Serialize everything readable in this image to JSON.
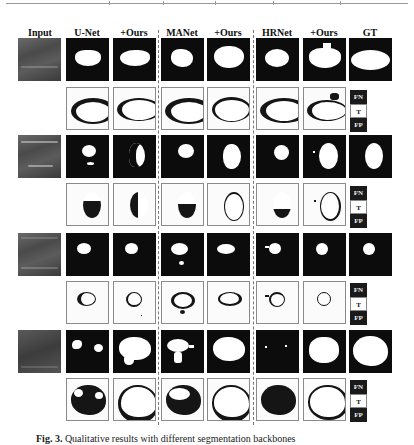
{
  "figure": {
    "caption_label": "Fig. 3.",
    "caption_text": "Qualitative results with different segmentation backbones"
  },
  "columns": [
    {
      "key": "input",
      "label": "Input"
    },
    {
      "key": "unet",
      "label": "U-Net"
    },
    {
      "key": "unet_ours",
      "label": "+Ours"
    },
    {
      "key": "manet",
      "label": "MANet"
    },
    {
      "key": "manet_ours",
      "label": "+Ours"
    },
    {
      "key": "hrnet",
      "label": "HRNet"
    },
    {
      "key": "hrnet_ours",
      "label": "+Ours"
    },
    {
      "key": "gt",
      "label": "GT"
    }
  ],
  "legend": {
    "fn": "FN",
    "t": "T",
    "fp": "FP"
  },
  "samples": [
    {
      "index": 1,
      "rows": [
        "prediction",
        "error-map"
      ]
    },
    {
      "index": 2,
      "rows": [
        "prediction",
        "error-map"
      ]
    },
    {
      "index": 3,
      "rows": [
        "prediction",
        "error-map"
      ]
    },
    {
      "index": 4,
      "rows": [
        "prediction",
        "error-map"
      ]
    }
  ],
  "colors": {
    "mask_background": "#0c0c0c",
    "mask_foreground": "#ffffff",
    "error_background": "#fbfbfb",
    "error_region": "#151515",
    "separator": "#777777"
  }
}
